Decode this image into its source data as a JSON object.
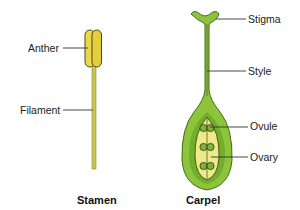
{
  "diagram": {
    "stamen": {
      "title": "Stamen",
      "labels": {
        "anther": "Anther",
        "filament": "Filament"
      }
    },
    "carpel": {
      "title": "Carpel",
      "labels": {
        "stigma": "Stigma",
        "style": "Style",
        "ovule": "Ovule",
        "ovary": "Ovary"
      }
    }
  },
  "colors": {
    "anther_fill": "#ecd64a",
    "filament_fill": "#c8c45a",
    "carpel_outer": "#8cc43c",
    "carpel_inner": "#6aa72a",
    "ovary_chamber": "#eeea8a",
    "ovule_fill": "#7fb23a",
    "outline": "#3a4a14",
    "leader": "#333333"
  }
}
